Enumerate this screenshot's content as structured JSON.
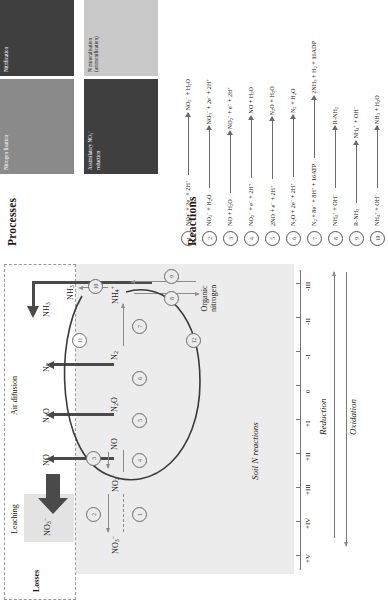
{
  "figure": {
    "title_processes": "Processes",
    "title_reactions": "Reactions"
  },
  "legend": {
    "items": [
      {
        "id": "nitrogen-fixation",
        "label": "Nitrogen fixation",
        "color": "#8a8a8a"
      },
      {
        "id": "nitrification",
        "label": "Nitrification",
        "color": "#3f3f3f"
      },
      {
        "id": "denitrification",
        "label": "Denitrification (dissimilatory NO3- reduction)",
        "label_html": "Denitrification<br>(dissimilatory NO<sub>3</sub><sup>&#8722;</sup><br>reduction)",
        "color": "#c9c9c9"
      },
      {
        "id": "assimilatory-no3-reduction",
        "label": "Assimilatory NO3- reduction",
        "label_html": "Assimilatory NO<sub>3</sub><sup>&#8722;</sup><br>reduction",
        "color": "#3f3f3f"
      },
      {
        "id": "n-mineralisation",
        "label": "N mineralisation (ammonification)",
        "label_html": "N mineralisation<br>(ammonification)",
        "color": "#c9c9c9"
      }
    ]
  },
  "reactions": [
    {
      "n": "1",
      "left_html": "NO<sub>3</sub><sup>&#8722;</sup> + 2e<sup>&#8722;</sup> + 2H<sup>+</sup>",
      "right_html": "NO<sub>2</sub><sup>&#8722;</sup> + H<sub>2</sub>O",
      "left": "NO3- + 2e- + 2H+",
      "right": "NO2- + H2O"
    },
    {
      "n": "2",
      "left_html": "NO<sub>2</sub><sup>&#8722;</sup> + H<sub>2</sub>O",
      "right_html": "NO<sub>3</sub><sup>&#8722;</sup> + 2e<sup>&#8722;</sup> + 2H<sup>+</sup>",
      "left": "NO2- + H2O",
      "right": "NO3- + 2e- + 2H+"
    },
    {
      "n": "3",
      "left_html": "NO + H<sub>2</sub>O",
      "right_html": "NO<sub>2</sub><sup>&#8722;</sup> + e<sup>&#8722;</sup> + 2H<sup>+</sup>",
      "left": "NO + H2O",
      "right": "NO2- + e- + 2H+"
    },
    {
      "n": "4",
      "left_html": "NO<sub>2</sub><sup>&#8722;</sup> + e<sup>&#8722;</sup> + 2H<sup>+</sup>",
      "right_html": "NO + H<sub>2</sub>O",
      "left": "NO2- + e- + 2H+",
      "right": "NO + H2O"
    },
    {
      "n": "5",
      "left_html": "2NO + e<sup>&#8722;</sup> + 2H<sup>+</sup>",
      "right_html": "N<sub>2</sub>O + H<sub>2</sub>O",
      "left": "2NO + e- + 2H+",
      "right": "N2O + H2O"
    },
    {
      "n": "6",
      "left_html": "N<sub>2</sub>O + 2e<sup>&#8722;</sup> + 2H<sup>+</sup>",
      "right_html": "N<sub>2</sub> + H<sub>2</sub>O",
      "left": "N2O + 2e- + 2H+",
      "right": "N2 + H2O"
    },
    {
      "n": "7",
      "left_html": "N<sub>2</sub> + 8e<sup>&#8722;</sup> + 8H<sup>+</sup> + 16ATP",
      "right_html": "2NH<sub>3</sub> + H<sub>2</sub> + 16ADP",
      "left": "N2 + 8e- + 8H+ + 16ATP",
      "right": "2NH3 + H2 + 16ADP"
    },
    {
      "n": "8",
      "left_html": "NH<sub>4</sub><sup>+</sup> + OH<sup>&#8722;</sup>",
      "right_html": "R-NH<sub>2</sub>",
      "left": "NH4+ + OH-",
      "right": "R-NH2"
    },
    {
      "n": "9",
      "left_html": "R-NH<sub>2</sub>",
      "right_html": "NH<sub>4</sub><sup>+</sup> + OH<sup>&#8722;</sup>",
      "left": "R-NH2",
      "right": "NH4+ + OH-"
    },
    {
      "n": "10",
      "left_html": "NH<sub>4</sub><sup>+</sup> + OH<sup>&#8722;</sup>",
      "right_html": "NH<sub>3</sub> + H<sub>2</sub>O",
      "left": "NH4+ + OH-",
      "right": "NH3 + H2O"
    }
  ],
  "diagram": {
    "losses_title": "Losses",
    "leaching_title": "Leaching",
    "air_diffusion_title": "Air difusion",
    "soil_title": "Soil N reactions",
    "loss_species": [
      {
        "id": "no3-leached",
        "label_html": "NO<sub>3</sub><sup>&#8722;</sup>",
        "label": "NO3-"
      },
      {
        "id": "no-gas",
        "label_html": "NO",
        "label": "NO"
      },
      {
        "id": "n2o-gas",
        "label_html": "N<sub>2</sub>O",
        "label": "N2O"
      },
      {
        "id": "n2-gas",
        "label_html": "N<sub>2</sub>",
        "label": "N2"
      },
      {
        "id": "nh3-gas",
        "label_html": "NH<sub>3</sub>",
        "label": "NH3"
      }
    ],
    "soil_species": [
      {
        "id": "no3",
        "label_html": "NO<sub>3</sub><sup>&#8722;</sup>",
        "label": "NO3-"
      },
      {
        "id": "no2",
        "label_html": "NO<sub>2</sub><sup>&#8722;</sup>",
        "label": "NO2-"
      },
      {
        "id": "no",
        "label_html": "NO",
        "label": "NO"
      },
      {
        "id": "n2o",
        "label_html": "N<sub>2</sub>O",
        "label": "N2O"
      },
      {
        "id": "n2",
        "label_html": "N<sub>2</sub>",
        "label": "N2"
      },
      {
        "id": "nh4",
        "label_html": "NH<sub>4</sub><sup>+</sup>",
        "label": "NH4+"
      },
      {
        "id": "nh3",
        "label_html": "NH<sub>3</sub>",
        "label": "NH3"
      },
      {
        "id": "organic",
        "label_html": "Organic<br>nitrogen",
        "label": "Organic nitrogen"
      }
    ],
    "step_numbers": [
      "1",
      "2",
      "3",
      "4",
      "5",
      "6",
      "7",
      "8",
      "9",
      "10",
      "11",
      "12"
    ],
    "oxidation_states": [
      "+V",
      "+IV",
      "+III",
      "+II",
      "+I",
      "0",
      "-I",
      "-II",
      "-III"
    ],
    "reduction_label": "Reduction",
    "oxidation_label": "Oxidation"
  },
  "colors": {
    "dark": "#3f3f3f",
    "mid": "#8a8a8a",
    "light": "#c9c9c9",
    "soil_bg": "#ececec",
    "line": "#8b8b8b",
    "thick_line": "#4a4a4a"
  }
}
